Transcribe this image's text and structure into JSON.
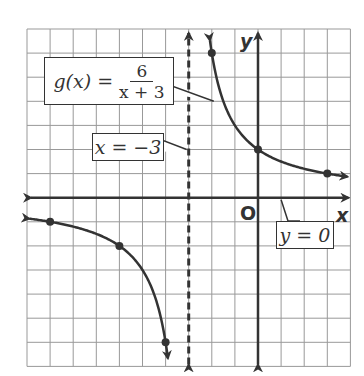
{
  "function_label": {
    "lhs": "g(x) =",
    "numerator": "6",
    "denominator": "x + 3"
  },
  "vertical_asymptote_label": "x = −3",
  "horizontal_asymptote_label": "y = 0",
  "axes": {
    "x_label": "x",
    "y_label": "y",
    "origin_label": "O"
  },
  "colors": {
    "grid": "#999999",
    "curve": "#333333",
    "background": "#ffffff"
  },
  "chart_data": {
    "type": "line",
    "xlabel": "x",
    "ylabel": "y",
    "xlim": [
      -10,
      4
    ],
    "ylim": [
      -7,
      7
    ],
    "grid": true,
    "asymptotes": {
      "vertical": -3,
      "horizontal": 0
    },
    "points": [
      [
        -9,
        -1
      ],
      [
        -6,
        -2
      ],
      [
        -4,
        -6
      ],
      [
        -2,
        6
      ],
      [
        0,
        2
      ],
      [
        3,
        1
      ]
    ],
    "function": "6/(x+3)"
  }
}
